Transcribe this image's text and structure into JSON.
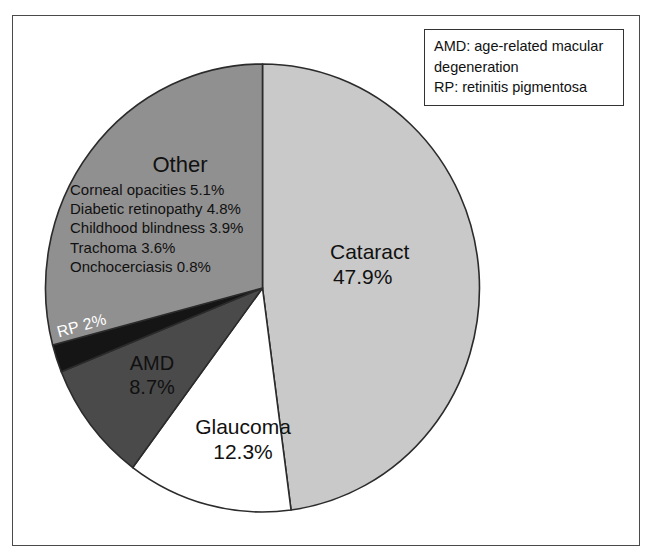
{
  "figure": {
    "kind": "pie-chart-figure",
    "background": "#ffffff",
    "frame_color": "#4a4a4a"
  },
  "legend_box": {
    "name": "abbreviation-key",
    "lines": [
      "AMD: age-related macular",
      "degeneration",
      "RP: retinitis pigmentosa"
    ]
  },
  "labels": {
    "cataract": {
      "name": "Cataract",
      "pct": "47.9%"
    },
    "glaucoma": {
      "name": "Glaucoma",
      "pct": "12.3%"
    },
    "amd": {
      "name": "AMD",
      "pct": "8.7%"
    },
    "rp": {
      "text": "RP 2%"
    },
    "other": {
      "title": "Other",
      "items": [
        "Corneal opacities 5.1%",
        "Diabetic retinopathy 4.8%",
        "Childhood blindness 3.9%",
        "Trachoma 3.6%",
        "Onchocerciasis 0.8%"
      ]
    }
  },
  "chart_data": {
    "type": "pie",
    "title": "",
    "subtitle": "",
    "xlabel": "",
    "ylabel": "",
    "legend_position": "top-right",
    "grid": false,
    "start_angle_deg": 0,
    "direction": "clockwise",
    "units": "percent",
    "categories": [
      "Cataract",
      "Glaucoma",
      "AMD",
      "RP",
      "Other"
    ],
    "values": [
      47.9,
      12.3,
      8.7,
      2.0,
      29.2
    ],
    "colors": [
      "#c9c9c9",
      "#ffffff",
      "#4a4a4a",
      "#151515",
      "#909090"
    ],
    "label_text_colors": [
      "#111111",
      "#111111",
      "#111111",
      "#ffffff",
      "#111111"
    ],
    "slices": [
      {
        "label": "Cataract",
        "value": 47.9,
        "display": "47.9%",
        "color": "#c9c9c9",
        "start_deg": 0,
        "end_deg": 172.44
      },
      {
        "label": "Glaucoma",
        "value": 12.3,
        "display": "12.3%",
        "color": "#ffffff",
        "start_deg": 172.44,
        "end_deg": 216.72
      },
      {
        "label": "AMD",
        "value": 8.7,
        "display": "8.7%",
        "color": "#4a4a4a",
        "start_deg": 216.72,
        "end_deg": 248.04
      },
      {
        "label": "RP",
        "value": 2.0,
        "display": "RP 2%",
        "color": "#151515",
        "start_deg": 248.04,
        "end_deg": 255.24
      },
      {
        "label": "Other",
        "value": 29.2,
        "display": "",
        "color": "#909090",
        "start_deg": 255.24,
        "end_deg": 360
      }
    ],
    "other_breakdown": {
      "group": "Other",
      "categories": [
        "Corneal opacities",
        "Diabetic retinopathy",
        "Childhood blindness",
        "Trachoma",
        "Onchocerciasis"
      ],
      "values": [
        5.1,
        4.8,
        3.9,
        3.6,
        0.8
      ],
      "displays": [
        "5.1%",
        "4.8%",
        "3.9%",
        "3.6%",
        "0.8%"
      ]
    },
    "annotations": [
      "AMD: age-related macular degeneration",
      "RP: retinitis pigmentosa"
    ]
  }
}
